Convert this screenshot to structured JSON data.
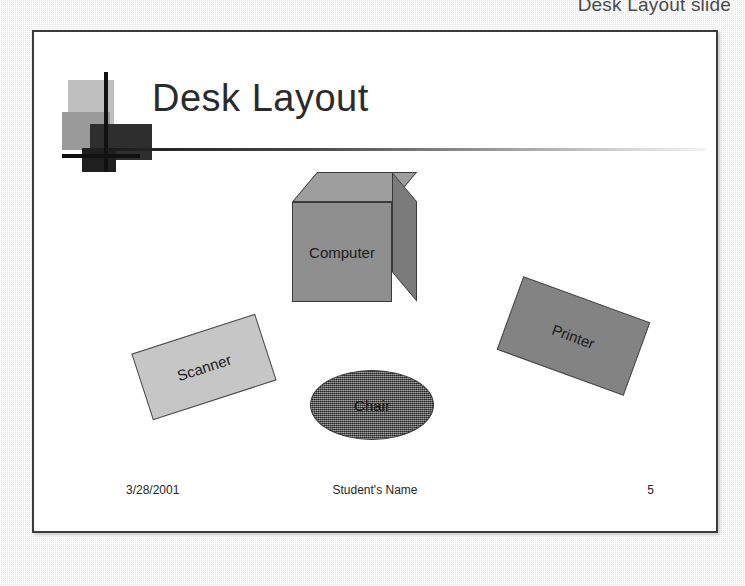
{
  "caption": "Desk Layout slide",
  "slide": {
    "title": "Desk Layout",
    "shapes": [
      {
        "name": "computer",
        "label": "Computer",
        "type": "cube",
        "fill": "#8f8f8f"
      },
      {
        "name": "scanner",
        "label": "Scanner",
        "type": "rectangle",
        "fill": "#c6c6c6",
        "rotation": "-18deg"
      },
      {
        "name": "printer",
        "label": "Printer",
        "type": "rectangle",
        "fill": "#838383",
        "rotation": "20deg"
      },
      {
        "name": "chair",
        "label": "Chair",
        "type": "ellipse",
        "fill": "#4f4f4f"
      }
    ],
    "footer": {
      "date": "3/28/2001",
      "name": "Student's Name",
      "number": "5"
    }
  },
  "colors": {
    "page_background": "#e8e8e8",
    "slide_background": "#ffffff",
    "slide_border": "#3b3b3b",
    "title_text": "#2b2b2b",
    "footer_text": "#262626",
    "deco_dark": "#111111",
    "deco_light_square": "#bfbfbf",
    "deco_mid_square": "#9a9a9a"
  }
}
